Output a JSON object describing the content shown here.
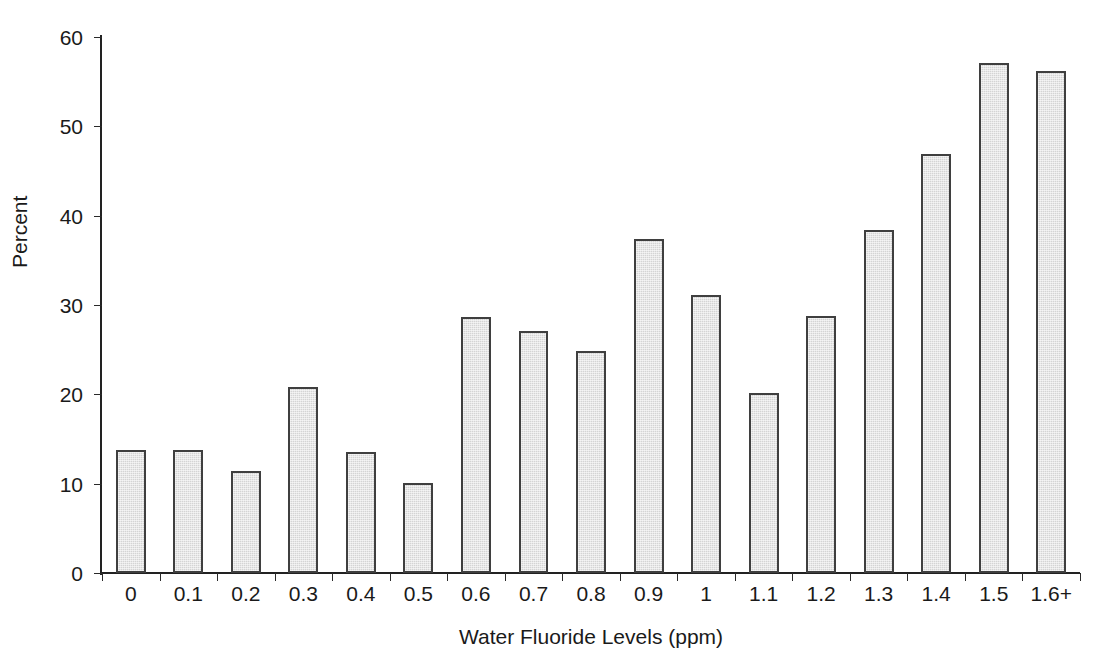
{
  "chart_data": {
    "type": "bar",
    "title": "",
    "xlabel": "Water Fluoride Levels (ppm)",
    "ylabel": "Percent",
    "categories": [
      "0",
      "0.1",
      "0.2",
      "0.3",
      "0.4",
      "0.5",
      "0.6",
      "0.7",
      "0.8",
      "0.9",
      "1",
      "1.1",
      "1.2",
      "1.3",
      "1.4",
      "1.5",
      "1.6+"
    ],
    "values": [
      13.8,
      13.8,
      11.4,
      20.8,
      13.6,
      10.1,
      28.7,
      27.1,
      24.8,
      37.4,
      31.1,
      20.1,
      28.8,
      38.4,
      46.9,
      57.1,
      56.2
    ],
    "ylim": [
      0,
      60
    ],
    "ytick_labels": [
      "0",
      "10",
      "20",
      "30",
      "40",
      "50",
      "60"
    ],
    "ytick_values": [
      0,
      10,
      20,
      30,
      40,
      50,
      60
    ],
    "grid": "horizontal",
    "legend": "none",
    "bar_fill_color": "#d4d4d4",
    "bar_border_color": "#3f3f3f",
    "axis_color": "#222222",
    "gridline_color": "#3a3a3a",
    "background_color": "#ffffff"
  }
}
